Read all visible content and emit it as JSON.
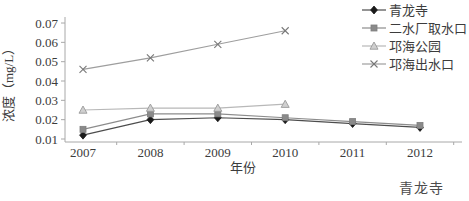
{
  "chart_data": {
    "type": "line",
    "title": "",
    "xlabel": "年份",
    "ylabel": "浓度（mg/L）",
    "x": [
      "2007",
      "2008",
      "2009",
      "2010",
      "2011",
      "2012"
    ],
    "ylim": [
      0.01,
      0.07
    ],
    "ytick_step": 0.01,
    "grid": false,
    "legend_position": "top-right",
    "series": [
      {
        "name": "青龙寺",
        "marker": "diamond",
        "color": "#4d4d4d",
        "marker_color": "#1a1a1a",
        "marker_fill": "#1a1a1a",
        "values": [
          0.012,
          0.02,
          0.021,
          0.02,
          0.018,
          0.016
        ]
      },
      {
        "name": "二水厂取水口",
        "marker": "square",
        "color": "#8c8c8c",
        "marker_color": "#7d7d7d",
        "marker_fill": "#8a8a8a",
        "values": [
          0.015,
          0.023,
          0.023,
          0.021,
          0.019,
          0.017
        ]
      },
      {
        "name": "邛海公园",
        "marker": "triangle",
        "color": "#b8b8b8",
        "marker_color": "#9a9a9a",
        "marker_fill": "#cfcfcf",
        "values": [
          0.025,
          0.026,
          0.026,
          0.028,
          null,
          null
        ]
      },
      {
        "name": "邛海出水口",
        "marker": "x",
        "color": "#9e9e9e",
        "marker_color": "#787878",
        "marker_fill": "none",
        "values": [
          0.046,
          0.052,
          0.059,
          0.066,
          null,
          null
        ]
      }
    ]
  },
  "footer": {
    "caption": "青龙寺"
  }
}
